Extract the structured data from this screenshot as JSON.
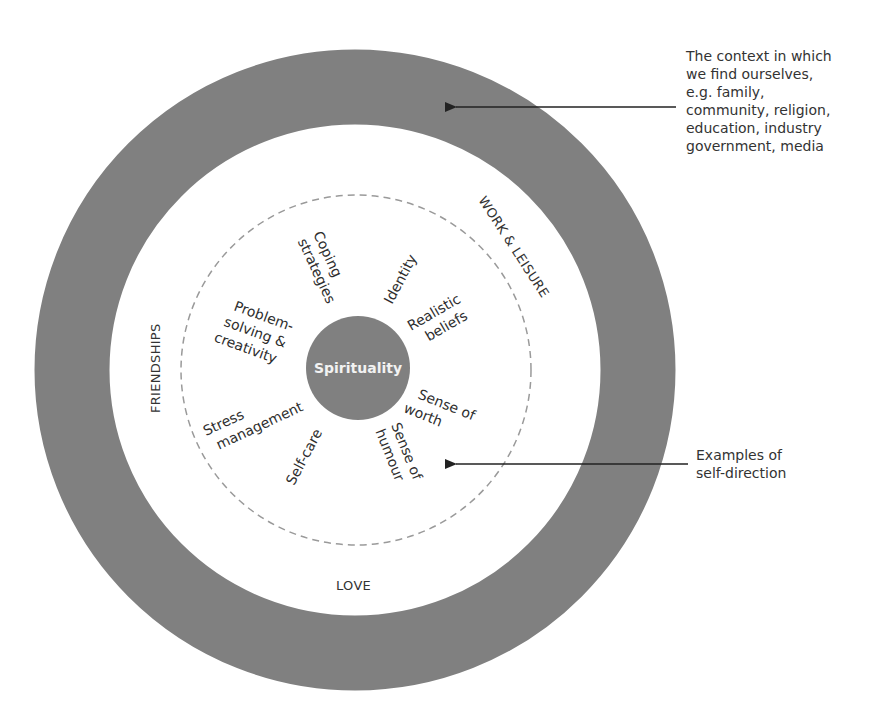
{
  "diagram": {
    "colors": {
      "outer_ring": "#808080",
      "core_circle": "#808080",
      "dashed_circle": "#9a9a9a",
      "text": "#2e2e2e",
      "arrow": "#222222"
    },
    "core": {
      "label": "Spirituality"
    },
    "ring_labels": {
      "work_leisure": "WORK & LEISURE",
      "friendships": "FRIENDSHIPS",
      "love": "LOVE"
    },
    "self_direction_items": [
      {
        "line1": "Coping",
        "line2": "strategies"
      },
      {
        "line1": "Identity",
        "line2": ""
      },
      {
        "line1": "Realistic",
        "line2": "beliefs"
      },
      {
        "line1": "Sense of",
        "line2": "worth"
      },
      {
        "line1": "Sense of",
        "line2": "humour"
      },
      {
        "line1": "Self-care",
        "line2": ""
      },
      {
        "line1": "Stress",
        "line2": "management"
      },
      {
        "line1": "Problem-",
        "line2": "solving &",
        "line3": "creativity"
      }
    ],
    "annotations": {
      "context": "The context in which\nwe find ourselves,\ne.g. family,\ncommunity, religion,\neducation, industry\ngovernment, media",
      "self_direction": "Examples of\nself-direction"
    }
  }
}
